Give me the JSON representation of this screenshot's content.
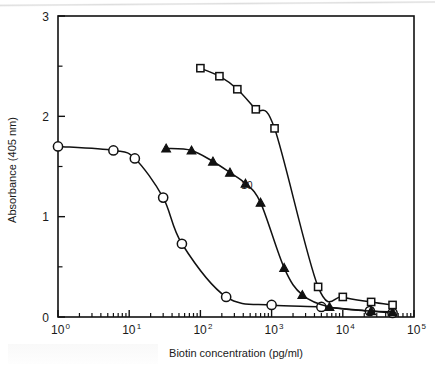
{
  "figure": {
    "caption_partial": "",
    "background_color": "#ffffff",
    "ink_color": "#111111"
  },
  "chart_data": {
    "type": "line",
    "title": "",
    "subtitle": "",
    "xlabel": "Biotin concentration (pg/ml)",
    "ylabel": "Absorbance (405 nm)",
    "xscale": "log",
    "yscale": "linear",
    "xlim": [
      1,
      100000
    ],
    "ylim": [
      0,
      3
    ],
    "grid": false,
    "legend_position": "none",
    "x_tick_labels": [
      "10⁰",
      "10¹",
      "10²",
      "10³",
      "10⁴",
      "10⁵"
    ],
    "x_tick_bases": [
      "10",
      "10",
      "10",
      "10",
      "10",
      "10"
    ],
    "x_tick_exponents": [
      "0",
      "1",
      "2",
      "3",
      "4",
      "5"
    ],
    "x_tick_values": [
      1,
      10,
      100,
      1000,
      10000,
      100000
    ],
    "y_tick_labels": [
      "0",
      "1",
      "2",
      "3"
    ],
    "y_tick_values": [
      0,
      1,
      2,
      3
    ],
    "y_minor_tick_values": [
      0.5,
      1.5,
      2.5
    ],
    "annotations": [
      {
        "text": "10",
        "x": 450,
        "y": 1.28
      }
    ],
    "series": [
      {
        "name": "open-circle-series",
        "marker": "open-circle",
        "points": [
          {
            "x": 1,
            "y": 1.7
          },
          {
            "x": 6,
            "y": 1.66
          },
          {
            "x": 12,
            "y": 1.58
          },
          {
            "x": 30,
            "y": 1.19
          },
          {
            "x": 55,
            "y": 0.73
          },
          {
            "x": 230,
            "y": 0.2
          },
          {
            "x": 1000,
            "y": 0.12
          },
          {
            "x": 5000,
            "y": 0.1
          },
          {
            "x": 24000,
            "y": 0.06
          },
          {
            "x": 50000,
            "y": 0.04
          }
        ]
      },
      {
        "name": "filled-triangle-series",
        "marker": "filled-triangle",
        "points": [
          {
            "x": 33,
            "y": 1.68
          },
          {
            "x": 75,
            "y": 1.66
          },
          {
            "x": 150,
            "y": 1.55
          },
          {
            "x": 260,
            "y": 1.44
          },
          {
            "x": 430,
            "y": 1.33
          },
          {
            "x": 700,
            "y": 1.14
          },
          {
            "x": 1500,
            "y": 0.49
          },
          {
            "x": 2700,
            "y": 0.22
          },
          {
            "x": 6500,
            "y": 0.1
          },
          {
            "x": 25000,
            "y": 0.06
          },
          {
            "x": 50000,
            "y": 0.05
          }
        ]
      },
      {
        "name": "open-square-series",
        "marker": "open-square",
        "points": [
          {
            "x": 100,
            "y": 2.48
          },
          {
            "x": 185,
            "y": 2.4
          },
          {
            "x": 330,
            "y": 2.27
          },
          {
            "x": 600,
            "y": 2.07
          },
          {
            "x": 1100,
            "y": 1.88
          },
          {
            "x": 4500,
            "y": 0.3
          },
          {
            "x": 10000,
            "y": 0.2
          },
          {
            "x": 25000,
            "y": 0.15
          },
          {
            "x": 50000,
            "y": 0.12
          }
        ]
      }
    ]
  }
}
